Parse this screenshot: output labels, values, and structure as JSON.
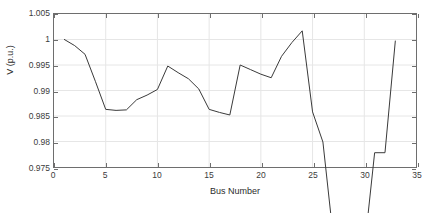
{
  "chart_data": {
    "type": "line",
    "title": "",
    "xlabel": "Bus Number",
    "ylabel": "V (p.u.)",
    "xlim": [
      0,
      35
    ],
    "ylim": [
      0.975,
      1.005
    ],
    "xticks": [
      0,
      5,
      10,
      15,
      20,
      25,
      30,
      35
    ],
    "xtick_labels": [
      "0",
      "5",
      "10",
      "15",
      "20",
      "25",
      "30",
      "35"
    ],
    "yticks": [
      0.975,
      0.98,
      0.985,
      0.99,
      0.995,
      1,
      1.005
    ],
    "ytick_labels": [
      "0.975",
      "0.98",
      "0.985",
      "0.99",
      "0.995",
      "1",
      "1.005"
    ],
    "grid": true,
    "legend": null,
    "line_color": "#3a3a3a",
    "line_width": 1,
    "markers": false,
    "x": [
      1,
      2,
      3,
      4,
      5,
      6,
      7,
      8,
      9,
      10,
      11,
      12,
      13,
      14,
      15,
      16,
      17,
      18,
      19,
      20,
      21,
      22,
      23,
      24,
      25,
      26,
      27,
      28,
      29,
      30,
      31,
      32,
      33
    ],
    "values": [
      1.0,
      0.9988,
      0.9971,
      0.9918,
      0.9863,
      0.9861,
      0.9862,
      0.9882,
      0.9891,
      0.9902,
      0.9948,
      0.9935,
      0.9923,
      0.9903,
      0.9863,
      0.9857,
      0.9852,
      0.995,
      0.9941,
      0.9932,
      0.9925,
      0.9967,
      0.9994,
      1.0017,
      0.9858,
      0.9799,
      0.9613,
      0.9615,
      0.9598,
      0.9588,
      0.9778,
      0.9778,
      0.9997
    ],
    "series_name": "Voltage magnitude"
  },
  "figure": {
    "background_color": "#ffffff",
    "axes_color": "#6e6e6e",
    "grid_color": "#e6e6e6"
  }
}
